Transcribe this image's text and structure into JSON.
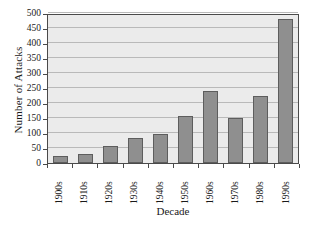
{
  "chart_data": {
    "type": "bar",
    "title": "",
    "xlabel": "Decade",
    "ylabel": "Number of Attacks",
    "categories": [
      "1900s",
      "1910s",
      "1920s",
      "1930s",
      "1940s",
      "1950s",
      "1960s",
      "1970s",
      "1980s",
      "1990s"
    ],
    "values": [
      25,
      30,
      58,
      84,
      98,
      156,
      241,
      150,
      222,
      481
    ],
    "ylim": [
      0,
      500
    ],
    "ytick_step": 50,
    "yticks": [
      0,
      50,
      100,
      150,
      200,
      250,
      300,
      350,
      400,
      450,
      500
    ],
    "ytick_labels": [
      "0",
      "50",
      "100",
      "150",
      "200",
      "250",
      "300",
      "350",
      "400",
      "450",
      "500"
    ],
    "grid": true,
    "legend": null,
    "series": [
      {
        "name": "Number of Attacks",
        "values": [
          25,
          30,
          58,
          84,
          98,
          156,
          241,
          150,
          222,
          481
        ]
      }
    ]
  },
  "style": {
    "bar_fill": "#8f8f8f",
    "bar_stroke": "#5d5d5d",
    "plot_background": "#ebebeb",
    "grid_color": "#b9b9b9",
    "axis_color": "#4a4a4a",
    "page_background": "#ffffff",
    "text_color": "#1a1a1a"
  }
}
